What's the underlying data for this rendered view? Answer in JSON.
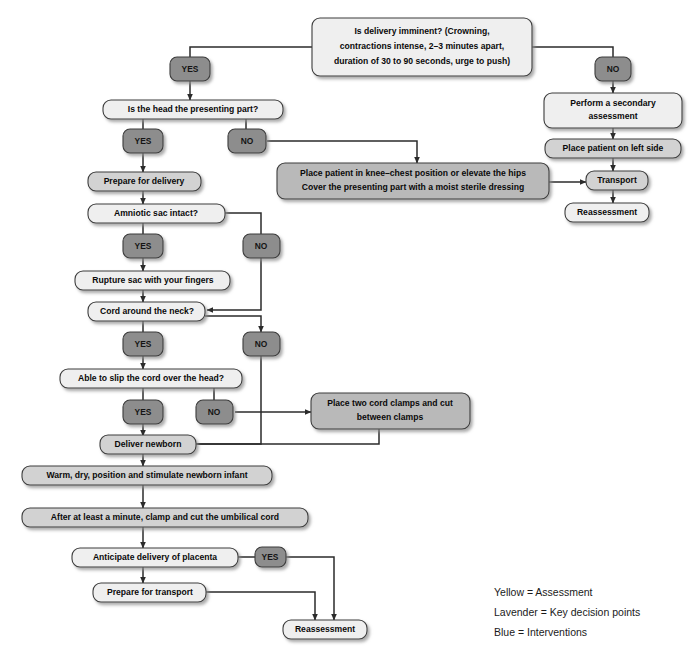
{
  "colors": {
    "background": "#ffffff",
    "assessment_box": "#efefef",
    "decision_box": "#d2d2d2",
    "intervention_box": "#b9b9b9",
    "pill": "#8d8d8d",
    "border": "#3c3c3c",
    "edge": "#2b2b2b",
    "text": "#0a0a0a"
  },
  "nodes": {
    "delivery_imminent": {
      "label_line1": "Is delivery imminent? (Crowning,",
      "label_line2": "contractions intense, 2–3 minutes apart,",
      "label_line3": "duration of 30 to 90 seconds, urge to push)",
      "kind": "assessment"
    },
    "head_presenting": {
      "label": "Is the head the presenting part?",
      "kind": "assessment"
    },
    "prepare_delivery": {
      "label": "Prepare for delivery",
      "kind": "decision"
    },
    "amniotic_sac": {
      "label": "Amniotic sac intact?",
      "kind": "assessment"
    },
    "rupture_sac": {
      "label": "Rupture sac with your fingers",
      "kind": "assessment"
    },
    "cord_neck": {
      "label": "Cord around the neck?",
      "kind": "assessment"
    },
    "slip_cord": {
      "label": "Able to slip the cord over the head?",
      "kind": "assessment"
    },
    "deliver_newborn": {
      "label": "Deliver newborn",
      "kind": "decision"
    },
    "warm_dry": {
      "label": "Warm, dry, position and stimulate newborn infant",
      "kind": "decision"
    },
    "after_minute": {
      "label": "After at least a minute, clamp and cut the umbilical cord",
      "kind": "decision"
    },
    "anticipate_placenta": {
      "label": "Anticipate delivery of placenta",
      "kind": "assessment"
    },
    "prepare_transport": {
      "label": "Prepare for transport",
      "kind": "assessment"
    },
    "reassessment_bottom": {
      "label": "Reassessment",
      "kind": "assessment"
    },
    "knee_chest": {
      "label_line1": "Place patient in knee–chest position or elevate the hips",
      "label_line2": "Cover the presenting part with a moist sterile dressing",
      "kind": "intervention"
    },
    "cord_clamps": {
      "label_line1": "Place two cord clamps and cut",
      "label_line2": "between clamps",
      "kind": "intervention"
    },
    "secondary_assessment": {
      "label_line1": "Perform a secondary",
      "label_line2": "assessment",
      "kind": "assessment"
    },
    "left_side": {
      "label": "Place patient on left side",
      "kind": "decision"
    },
    "transport": {
      "label": "Transport",
      "kind": "decision"
    },
    "reassessment_right": {
      "label": "Reassessment",
      "kind": "assessment"
    }
  },
  "pills": {
    "yes_top": "YES",
    "no_top": "NO",
    "yes_head": "YES",
    "no_head": "NO",
    "yes_sac": "YES",
    "no_sac": "NO",
    "yes_cord": "YES",
    "no_cord": "NO",
    "yes_slip": "YES",
    "no_slip": "NO",
    "yes_placenta": "YES"
  },
  "legend": {
    "items": [
      "Yellow = Assessment",
      "Lavender = Key decision points",
      "Blue = Interventions"
    ]
  }
}
